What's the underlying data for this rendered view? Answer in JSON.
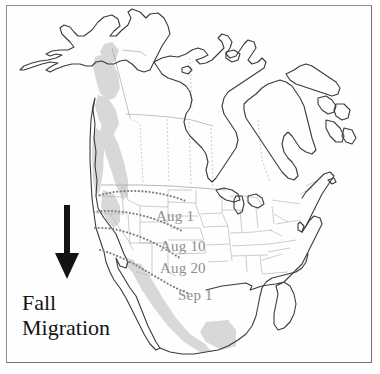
{
  "figure": {
    "type": "map",
    "frame_border_color": "#8d8f92",
    "background_color": "#ffffff"
  },
  "legend": {
    "arrow_icon": "down-arrow-icon",
    "arrow_direction": "down",
    "arrow_color": "#131313",
    "line1": "Fall",
    "line2": "Migration",
    "text_color": "#131313"
  },
  "isochrones": {
    "label_color": "#8e8e8e",
    "line_style": "dotted",
    "items": [
      {
        "label": "Aug 1",
        "left": 156,
        "top": 209
      },
      {
        "label": "Aug 10",
        "left": 160,
        "top": 239
      },
      {
        "label": "Aug 20",
        "left": 160,
        "top": 261
      },
      {
        "label": "Sep 1",
        "left": 178,
        "top": 288
      }
    ]
  },
  "map_layers": {
    "coastline_color": "#3b3b3b",
    "province_border_color": "#9a9a9a",
    "state_border_color": "#b4b4b4",
    "range_shading_color": "#d4d4d4",
    "range_shading_label": "breeding-range-shading"
  }
}
